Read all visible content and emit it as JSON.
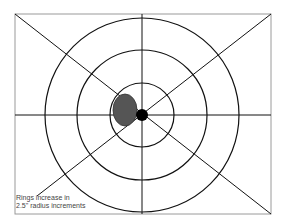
{
  "diagram": {
    "type": "target-rings",
    "frame": {
      "x": 15,
      "y": 14,
      "width": 256,
      "height": 200,
      "stroke": "#9a9a9a"
    },
    "center": {
      "x": 142,
      "y": 115
    },
    "ring_radii": [
      32,
      65,
      97
    ],
    "ring_color": "#111111",
    "center_dot": {
      "r": 6,
      "color": "#000000"
    },
    "impact_mark": {
      "cx": 125,
      "cy": 110,
      "rx": 12,
      "ry": 16,
      "color": "#555555"
    },
    "caption_lines": [
      "Rings increase in",
      "2.5\" radius increments"
    ]
  }
}
